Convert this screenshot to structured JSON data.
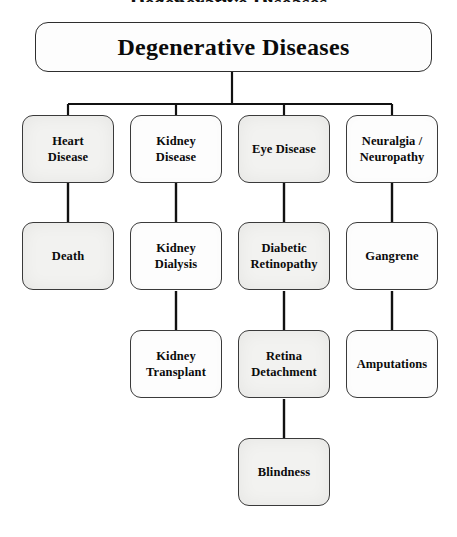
{
  "diagram": {
    "title_caption_partial": "Degenerative Diseases",
    "root": {
      "label": "Degenerative Diseases",
      "x": 35,
      "y": 22,
      "w": 397,
      "h": 50
    },
    "colors": {
      "background": "#ffffff",
      "box_border": "#3a3a3a",
      "box_fill_plain": "#fdfdfd",
      "box_fill_shaded": "#f2f2f0",
      "connector": "#111111",
      "text": "#0b0b0b"
    },
    "columns": [
      {
        "name": "heart",
        "center_x": 68
      },
      {
        "name": "kidney",
        "center_x": 176
      },
      {
        "name": "eye",
        "center_x": 284
      },
      {
        "name": "neuralgia",
        "center_x": 392
      }
    ],
    "levels": [
      {
        "name": "level-1",
        "y": 115,
        "nodes": [
          {
            "id": "heart-disease",
            "label": "Heart\nDisease",
            "col": 0,
            "fill": "shaded"
          },
          {
            "id": "kidney-disease",
            "label": "Kidney\nDisease",
            "col": 1,
            "fill": "plain"
          },
          {
            "id": "eye-disease",
            "label": "Eye Disease",
            "col": 2,
            "fill": "shaded"
          },
          {
            "id": "neuralgia-neuropathy",
            "label": "Neuralgia /\nNeuropathy",
            "col": 3,
            "fill": "plain"
          }
        ]
      },
      {
        "name": "level-2",
        "y": 222,
        "nodes": [
          {
            "id": "death",
            "label": "Death",
            "col": 0,
            "fill": "shaded"
          },
          {
            "id": "kidney-dialysis",
            "label": "Kidney\nDialysis",
            "col": 1,
            "fill": "plain"
          },
          {
            "id": "diabetic-retinopathy",
            "label": "Diabetic\nRetinopathy",
            "col": 2,
            "fill": "shaded"
          },
          {
            "id": "gangrene",
            "label": "Gangrene",
            "col": 3,
            "fill": "plain"
          }
        ]
      },
      {
        "name": "level-3",
        "y": 330,
        "nodes": [
          {
            "id": "kidney-transplant",
            "label": "Kidney\nTransplant",
            "col": 1,
            "fill": "plain"
          },
          {
            "id": "retina-detachment",
            "label": "Retina\nDetachment",
            "col": 2,
            "fill": "shaded"
          },
          {
            "id": "amputations",
            "label": "Amputations",
            "col": 3,
            "fill": "plain"
          }
        ]
      },
      {
        "name": "level-4",
        "y": 438,
        "nodes": [
          {
            "id": "blindness",
            "label": "Blindness",
            "col": 2,
            "fill": "shaded"
          }
        ]
      }
    ],
    "node_size": {
      "w": 92,
      "h": 68
    },
    "connectors": {
      "root_stem": {
        "x": 232,
        "y1": 72,
        "y2": 104
      },
      "bus": {
        "y": 104,
        "x1": 68,
        "x2": 392
      },
      "bus_drops": [
        {
          "x": 68,
          "y1": 104,
          "y2": 115
        },
        {
          "x": 176,
          "y1": 104,
          "y2": 115
        },
        {
          "x": 284,
          "y1": 104,
          "y2": 115
        },
        {
          "x": 392,
          "y1": 104,
          "y2": 115
        }
      ],
      "verticals": [
        {
          "from": "heart-disease",
          "to": "death",
          "x": 68,
          "y1": 183,
          "y2": 222
        },
        {
          "from": "kidney-disease",
          "to": "kidney-dialysis",
          "x": 176,
          "y1": 183,
          "y2": 222
        },
        {
          "from": "eye-disease",
          "to": "diabetic-retinopathy",
          "x": 284,
          "y1": 183,
          "y2": 222
        },
        {
          "from": "neuralgia-neuropathy",
          "to": "gangrene",
          "x": 392,
          "y1": 183,
          "y2": 222
        },
        {
          "from": "kidney-dialysis",
          "to": "kidney-transplant",
          "x": 176,
          "y1": 291,
          "y2": 330
        },
        {
          "from": "diabetic-retinopathy",
          "to": "retina-detachment",
          "x": 284,
          "y1": 291,
          "y2": 330
        },
        {
          "from": "gangrene",
          "to": "amputations",
          "x": 392,
          "y1": 291,
          "y2": 330
        },
        {
          "from": "retina-detachment",
          "to": "blindness",
          "x": 284,
          "y1": 399,
          "y2": 438
        }
      ]
    }
  }
}
